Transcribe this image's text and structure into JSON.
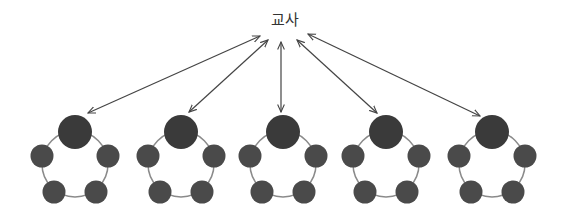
{
  "diagram": {
    "teacher_label": "교사",
    "colors": {
      "arrow": "#444444",
      "node_fill": "#4a4a4a",
      "leader_fill": "#3a3a3a",
      "ring": "#8a8a8a"
    },
    "groups": [
      {
        "id": 1,
        "members": 5
      },
      {
        "id": 2,
        "members": 5
      },
      {
        "id": 3,
        "members": 5
      },
      {
        "id": 4,
        "members": 5
      },
      {
        "id": 5,
        "members": 5
      }
    ]
  }
}
